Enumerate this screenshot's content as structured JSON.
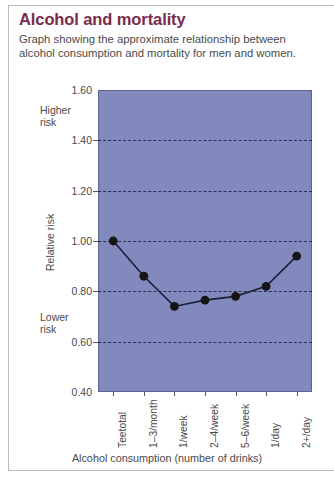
{
  "card": {
    "title": "Alcohol and mortality",
    "subtitle": "Graph showing the approximate relationship between alcohol consumption and mortality for men and women."
  },
  "annotations": {
    "higher_risk": "Higher risk",
    "lower_risk": "Lower risk"
  },
  "colors": {
    "title": "#7b2b4c",
    "plot_background": "#8189bd",
    "gridline": "#2b2f52",
    "series_line": "#1b1f3a",
    "marker": "#151515",
    "text": "#4a4a4a",
    "border": "#b9b9b9"
  },
  "chart_data": {
    "type": "line",
    "title": "Alcohol and mortality",
    "xlabel": "Alcohol consumption (number of drinks)",
    "ylabel": "Relative risk",
    "categories": [
      "Teetotal",
      "1–3/month",
      "1/week",
      "2–4/week",
      "5–6/week",
      "1/day",
      "2+/day"
    ],
    "values": [
      1.0,
      0.86,
      0.74,
      0.765,
      0.78,
      0.82,
      0.94
    ],
    "ylim": [
      0.4,
      1.6
    ],
    "yticks": [
      "1.60",
      "1.40",
      "1.20",
      "1.00",
      "0.80",
      "0.60",
      "0.40"
    ],
    "ytick_values": [
      1.6,
      1.4,
      1.2,
      1.0,
      0.8,
      0.6,
      0.4
    ],
    "gridlines_at": [
      1.4,
      1.2,
      1.0,
      0.8,
      0.6
    ],
    "grid": true,
    "legend": "none",
    "annotations": [
      "Higher risk",
      "Lower risk"
    ]
  }
}
